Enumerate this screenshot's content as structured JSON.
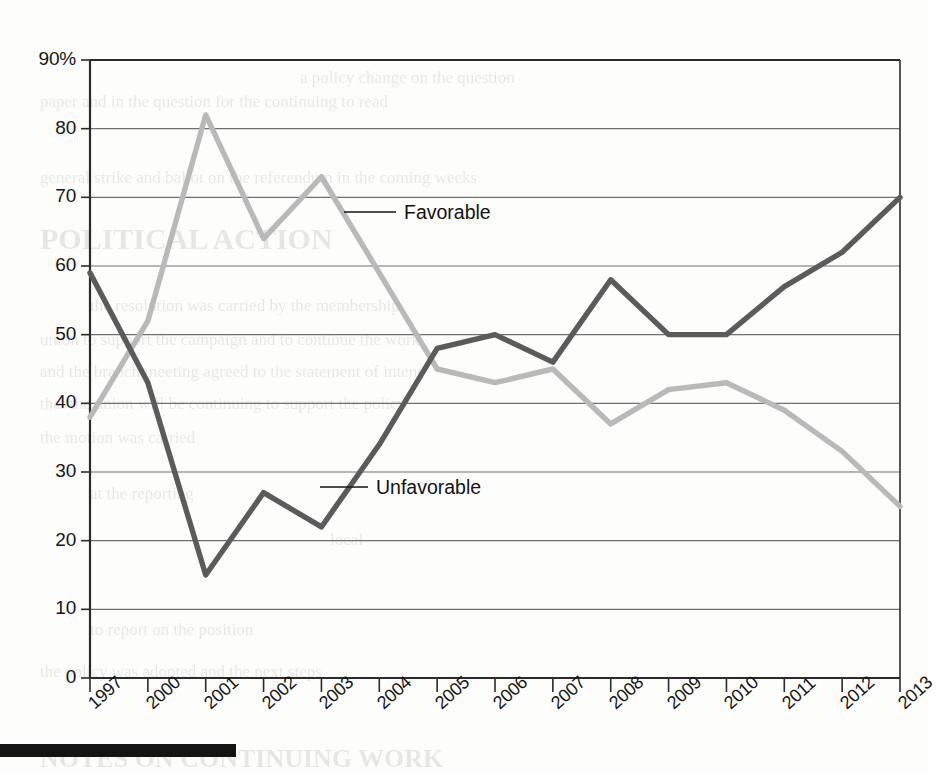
{
  "chart_data": {
    "type": "line",
    "title": "",
    "subtitle": "",
    "xlabel": "",
    "ylabel": "",
    "ylim": [
      0,
      90
    ],
    "y_ticks": [
      "0",
      "10",
      "20",
      "30",
      "40",
      "50",
      "60",
      "70",
      "80",
      "90%"
    ],
    "y_tick_values": [
      0,
      10,
      20,
      30,
      40,
      50,
      60,
      70,
      80,
      90
    ],
    "grid": true,
    "legend_position": "inline-annotations",
    "categories": [
      "1997",
      "2000",
      "2001",
      "2002",
      "2003",
      "2004",
      "2005",
      "2006",
      "2007",
      "2008",
      "2009",
      "2010",
      "2011",
      "2012",
      "2013"
    ],
    "x": [
      "1997",
      "2000",
      "2001",
      "2002",
      "2003",
      "2004",
      "2005",
      "2006",
      "2007",
      "2008",
      "2009",
      "2010",
      "2011",
      "2012",
      "2013"
    ],
    "series": [
      {
        "name": "Favorable",
        "color": "#b9b9b9",
        "values": [
          38,
          52,
          82,
          64,
          73,
          59,
          45,
          43,
          45,
          37,
          42,
          43,
          39,
          33,
          25
        ]
      },
      {
        "name": "Unfavorable",
        "color": "#5b5b5b",
        "values": [
          59,
          43,
          15,
          27,
          22,
          34,
          48,
          50,
          46,
          58,
          50,
          50,
          57,
          62,
          70
        ]
      }
    ],
    "annotations": [
      {
        "name": "favorable-callout",
        "text": "Favorable",
        "attached_series": "Favorable",
        "attached_x": "2004"
      },
      {
        "name": "unfavorable-callout",
        "text": "Unfavorable",
        "attached_series": "Unfavorable",
        "attached_x": "2004"
      }
    ]
  },
  "colors": {
    "favorable": "#b9b9b9",
    "unfavorable": "#5b5b5b",
    "axis": "#2b2b2b",
    "grid": "#6f6f6f",
    "text": "#151515",
    "rule": "#141414"
  },
  "ghost_text": {
    "lines": [
      "a policy change on the question",
      "paper and in the question for the continuing to read",
      "general strike and ballot on the referendum in the coming weeks",
      "POLITICAL ACTION",
      "the resolution was carried by the membership",
      "union to support the campaign and to continue the work",
      "and the branch meeting agreed to the statement of intent",
      "that the union will be continuing to support the policy",
      "the motion was carried",
      "at the reporting",
      "local",
      "to report on the position",
      "the policy was adopted and the next steps",
      "NOTES ON CONTINUING WORK"
    ]
  }
}
